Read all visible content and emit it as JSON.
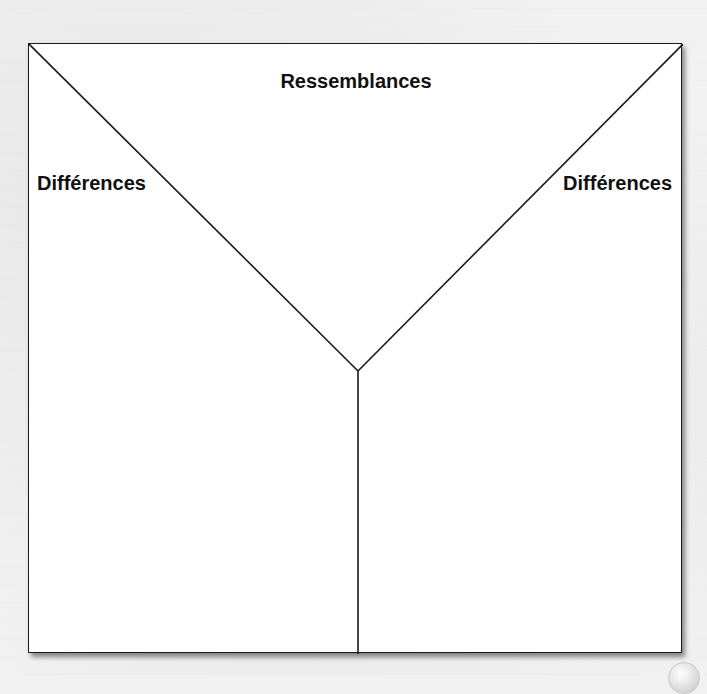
{
  "diagram": {
    "type": "Y-chart comparison organizer",
    "regions": {
      "top": {
        "label": "Ressemblances"
      },
      "left": {
        "label": "Différences"
      },
      "right": {
        "label": "Différences"
      }
    },
    "colors": {
      "frame_stroke": "#1a1a1a",
      "frame_fill": "#ffffff",
      "background": "#f1f1f1",
      "label_text": "#111111"
    }
  }
}
